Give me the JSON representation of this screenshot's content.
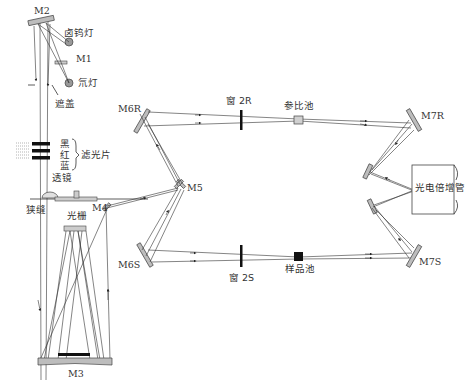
{
  "diagram": {
    "type": "optical-path",
    "labels": {
      "m1": "M1",
      "m2": "M2",
      "m3": "M3",
      "m4": "M4",
      "m5": "M5",
      "m6r": "M6R",
      "m6s": "M6S",
      "m7r": "M7R",
      "m7s": "M7S",
      "halogen_lamp": "卤钨灯",
      "deuterium_lamp": "氘灯",
      "shutter": "遮盖",
      "filter_black": "黑",
      "filter_red": "红",
      "filter_blue": "蓝",
      "filters": "滤光片",
      "lens": "透镜",
      "slit": "狭缝",
      "grating": "光栅",
      "window_2r": "窗 2R",
      "window_2s": "窗 2S",
      "reference_cell": "参比池",
      "sample_cell": "样品池",
      "photomultiplier": "光电倍增管"
    },
    "colors": {
      "line": "#333333",
      "mirror_fill": "#bdbdbd",
      "sample_cell": "#111111",
      "reference_cell": "#d0d0d0"
    }
  }
}
